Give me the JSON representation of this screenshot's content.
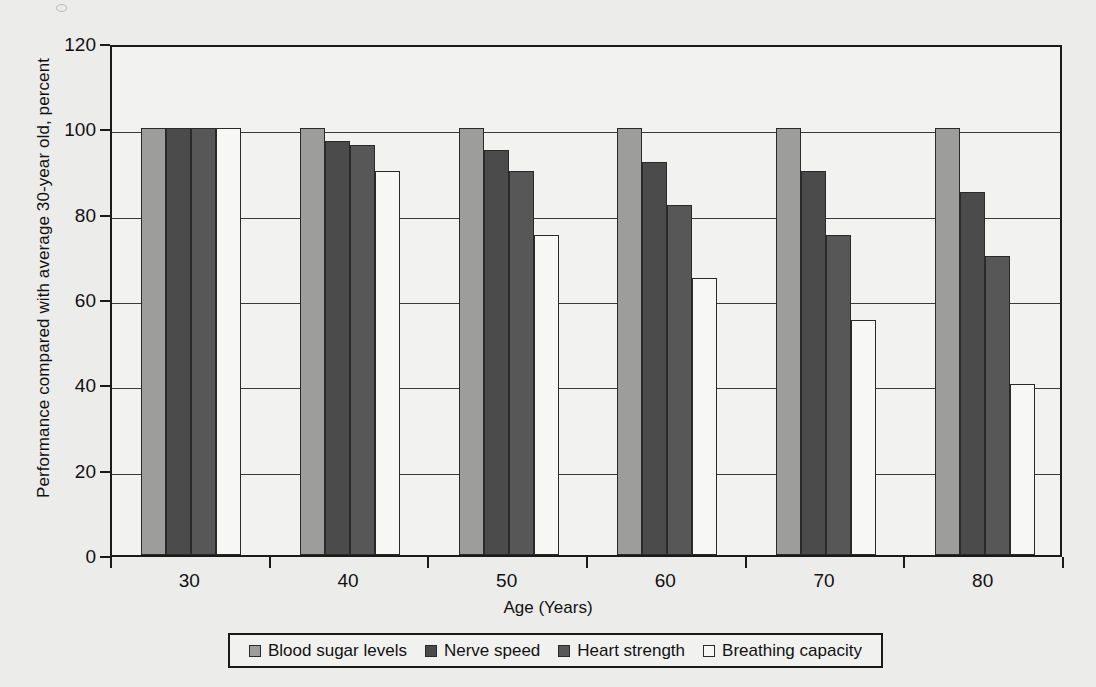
{
  "chart_data": {
    "type": "bar",
    "title": "",
    "xlabel": "Age (Years)",
    "ylabel": "Performance compared with average 30-year old, percent",
    "categories": [
      "30",
      "40",
      "50",
      "60",
      "70",
      "80"
    ],
    "ylim": [
      0,
      120
    ],
    "yticks": [
      0,
      20,
      40,
      60,
      80,
      100,
      120
    ],
    "grid": true,
    "legend_position": "bottom",
    "series": [
      {
        "name": "Blood sugar levels",
        "color": "#9d9d9b",
        "values": [
          100,
          100,
          100,
          100,
          100,
          100
        ]
      },
      {
        "name": "Nerve speed",
        "color": "#4b4b4b",
        "values": [
          100,
          97,
          95,
          92,
          90,
          85
        ]
      },
      {
        "name": "Heart strength",
        "color": "#575757",
        "values": [
          100,
          96,
          90,
          82,
          75,
          70
        ]
      },
      {
        "name": "Breathing capacity",
        "color": "#f7f7f6",
        "values": [
          100,
          90,
          75,
          65,
          55,
          40
        ]
      }
    ]
  },
  "axis": {
    "y_tick_labels": [
      "0",
      "20",
      "40",
      "60",
      "80",
      "100",
      "120"
    ],
    "x_tick_labels": [
      "30",
      "40",
      "50",
      "60",
      "70",
      "80"
    ],
    "x_title": "Age (Years)",
    "y_title": "Performance compared with average 30-year old, percent"
  },
  "legend": {
    "items": [
      {
        "label": "Blood sugar levels",
        "color": "#9d9d9b"
      },
      {
        "label": "Nerve speed",
        "color": "#4b4b4b"
      },
      {
        "label": "Heart strength",
        "color": "#575757"
      },
      {
        "label": "Breathing capacity",
        "color": "#f7f7f6"
      }
    ]
  }
}
